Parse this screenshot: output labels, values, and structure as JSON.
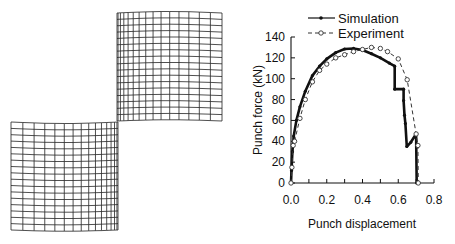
{
  "figure": {
    "left_panel": {
      "description": "Deformed finite element mesh of sheared cylindrical blank (two halves)"
    }
  },
  "chart_data": {
    "type": "line",
    "title": "",
    "xlabel": "Punch displacement",
    "ylabel": "Punch force (kN)",
    "xlim": [
      0.0,
      0.8
    ],
    "ylim": [
      0,
      140
    ],
    "xticks": [
      "0.0",
      "0.2",
      "0.4",
      "0.6",
      "0.8"
    ],
    "yticks": [
      "0",
      "20",
      "40",
      "60",
      "80",
      "100",
      "120",
      "140"
    ],
    "grid": false,
    "legend_position": "top",
    "series": [
      {
        "name": "Simulation",
        "style": "solid",
        "marker": "filled-dot",
        "color": "#111111",
        "points": [
          [
            0.0,
            0
          ],
          [
            0.003,
            12
          ],
          [
            0.008,
            30
          ],
          [
            0.015,
            45
          ],
          [
            0.03,
            60
          ],
          [
            0.05,
            73
          ],
          [
            0.08,
            88
          ],
          [
            0.12,
            103
          ],
          [
            0.16,
            112
          ],
          [
            0.2,
            119
          ],
          [
            0.25,
            125
          ],
          [
            0.3,
            128.5
          ],
          [
            0.35,
            129
          ],
          [
            0.4,
            127.5
          ],
          [
            0.45,
            124
          ],
          [
            0.5,
            120
          ],
          [
            0.55,
            115
          ],
          [
            0.58,
            112
          ],
          [
            0.58,
            90
          ],
          [
            0.63,
            90
          ],
          [
            0.63,
            79
          ],
          [
            0.635,
            65
          ],
          [
            0.64,
            57
          ],
          [
            0.648,
            35
          ],
          [
            0.67,
            39
          ],
          [
            0.7,
            47
          ],
          [
            0.703,
            0
          ]
        ]
      },
      {
        "name": "Experiment",
        "style": "dashed",
        "marker": "open-circle",
        "color": "#333333",
        "points": [
          [
            0.0,
            0
          ],
          [
            0.005,
            15
          ],
          [
            0.012,
            36
          ],
          [
            0.02,
            40
          ],
          [
            0.05,
            62
          ],
          [
            0.08,
            80
          ],
          [
            0.12,
            97
          ],
          [
            0.16,
            108
          ],
          [
            0.2,
            114
          ],
          [
            0.25,
            120
          ],
          [
            0.3,
            123
          ],
          [
            0.35,
            126
          ],
          [
            0.4,
            128
          ],
          [
            0.45,
            130
          ],
          [
            0.5,
            129
          ],
          [
            0.54,
            126
          ],
          [
            0.6,
            119
          ],
          [
            0.65,
            99
          ],
          [
            0.7,
            47
          ],
          [
            0.71,
            36
          ],
          [
            0.712,
            0
          ]
        ]
      }
    ]
  },
  "legend": {
    "simulation_label": "Simulation",
    "experiment_label": "Experiment"
  },
  "axes": {
    "xlabel": "Punch displacement",
    "ylabel": "Punch force (kN)",
    "xticks": [
      "0.0",
      "0.2",
      "0.4",
      "0.6",
      "0.8"
    ],
    "yticks": [
      "0",
      "20",
      "40",
      "60",
      "80",
      "100",
      "120",
      "140"
    ]
  }
}
